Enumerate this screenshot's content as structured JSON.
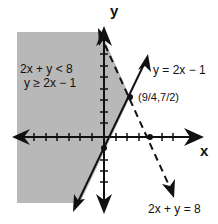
{
  "figure": {
    "type": "linear-inequality-graph",
    "axes": {
      "x_label": "x",
      "y_label": "y"
    },
    "region_label": {
      "line1": "2x + y < 8",
      "line2": "y ≥ 2x − 1"
    },
    "lines": [
      {
        "equation": "y = 2x − 1",
        "style": "solid"
      },
      {
        "equation": "2x + y = 8",
        "style": "dashed"
      }
    ],
    "intersection": {
      "label": "(9/4,7/2)",
      "x": 2.25,
      "y": 3.5
    },
    "marked_points": [
      {
        "x": 0,
        "y": -1
      },
      {
        "x": 4,
        "y": 0
      },
      {
        "x": 2.25,
        "y": 3.5
      }
    ],
    "shading": {
      "color": "#b8b8b8"
    },
    "line_color": "#111111"
  }
}
